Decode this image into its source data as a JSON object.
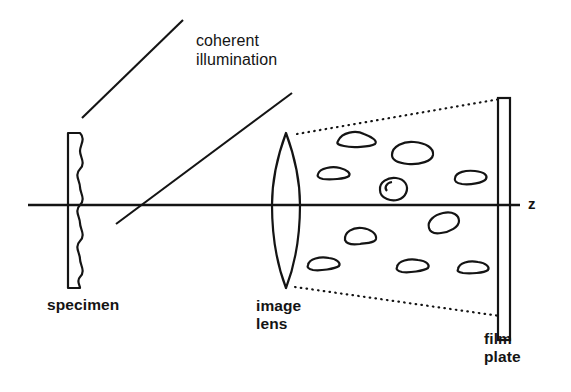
{
  "figure": {
    "background_color": "#ffffff",
    "stroke_color": "#141414",
    "labels": {
      "illumination_line1": "coherent",
      "illumination_line2": "illumination",
      "specimen": "specimen",
      "image_lens_line1": "image",
      "image_lens_line2": "lens",
      "film_plate_line1": "film",
      "film_plate_line2": "plate",
      "axis": "z"
    },
    "components": {
      "specimen": {
        "name": "specimen",
        "shape": "rectangle-with-wavy-right-edge",
        "x": 68,
        "y": 133,
        "width": 17,
        "height": 155
      },
      "image_lens": {
        "name": "image lens",
        "shape": "biconvex-lens",
        "center_x": 286,
        "top_y": 133,
        "bottom_y": 288,
        "half_width": 14
      },
      "film_plate": {
        "name": "film plate",
        "shape": "narrow-vertical-rectangle",
        "x": 498,
        "y": 98,
        "width": 12,
        "height": 242
      },
      "optical_axis": {
        "name": "z axis",
        "y": 205,
        "x_start": 28,
        "x_end": 520
      }
    },
    "illumination_rays": [
      {
        "x1": 82,
        "y1": 118,
        "x2": 183,
        "y2": 20
      },
      {
        "x1": 116,
        "y1": 224,
        "x2": 292,
        "y2": 93
      }
    ],
    "cone_lines": [
      {
        "style": "dotted",
        "x1": 296,
        "y1": 134,
        "x2": 500,
        "y2": 99
      },
      {
        "style": "dotted",
        "x1": 294,
        "y1": 287,
        "x2": 500,
        "y2": 316
      }
    ],
    "speckles": [
      {
        "cx": 356,
        "cy": 138,
        "rx": 19,
        "ry": 8,
        "rot": -8
      },
      {
        "cx": 412,
        "cy": 153,
        "rx": 21,
        "ry": 11,
        "rot": -6
      },
      {
        "cx": 333,
        "cy": 173,
        "rx": 16,
        "ry": 6,
        "rot": -5
      },
      {
        "cx": 470,
        "cy": 177,
        "rx": 16,
        "ry": 7,
        "rot": -7
      },
      {
        "cx": 392,
        "cy": 189,
        "rx": 14,
        "ry": 10,
        "rot": 12
      },
      {
        "cx": 443,
        "cy": 222,
        "rx": 16,
        "ry": 8,
        "rot": -14
      },
      {
        "cx": 360,
        "cy": 237,
        "rx": 17,
        "ry": 9,
        "rot": 10
      },
      {
        "cx": 323,
        "cy": 264,
        "rx": 17,
        "ry": 7,
        "rot": 6
      },
      {
        "cx": 412,
        "cy": 266,
        "rx": 17,
        "ry": 7,
        "rot": 4
      },
      {
        "cx": 472,
        "cy": 268,
        "rx": 16,
        "ry": 7,
        "rot": 3
      },
      {
        "cx": 306,
        "cy": 207,
        "rx": 0,
        "ry": 0,
        "rot": 0
      }
    ]
  }
}
